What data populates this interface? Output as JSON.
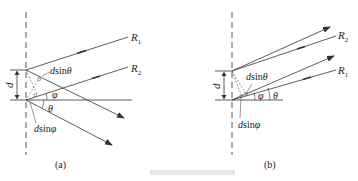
{
  "figure": {
    "panels": [
      {
        "id": "a",
        "label": "(a)",
        "rays": [
          "R1",
          "R2"
        ],
        "labels": {
          "R1": "R",
          "R1_sub": "1",
          "R2": "R",
          "R2_sub": "2",
          "d": "d",
          "dsin_theta_d": "d",
          "dsin_theta_rest": "sin",
          "dsin_theta_angle": "θ",
          "dsin_phi_d": "d",
          "dsin_phi_rest": "sin",
          "dsin_phi_angle": "φ",
          "phi": "φ",
          "theta": "θ"
        }
      },
      {
        "id": "b",
        "label": "(b)",
        "rays": [
          "R2",
          "R1"
        ],
        "labels": {
          "R1": "R",
          "R1_sub": "1",
          "R2": "R",
          "R2_sub": "2",
          "d": "d",
          "dsin_theta_d": "d",
          "dsin_theta_rest": "sin",
          "dsin_theta_angle": "θ",
          "dsin_phi_d": "d",
          "dsin_phi_rest": "sin",
          "dsin_phi_angle": "φ",
          "phi": "φ",
          "theta": "θ"
        }
      }
    ],
    "colors": {
      "line": "#333333",
      "dashed": "#444444"
    }
  }
}
